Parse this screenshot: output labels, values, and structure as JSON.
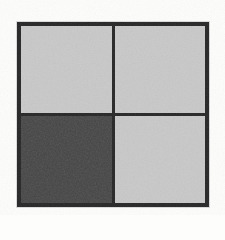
{
  "figure": {
    "medium": "scanned grayscale figure",
    "background_color": "#fdfdfc",
    "border_color": "#272727",
    "border_width_px": 4,
    "divider_width_px": 3,
    "columns": 2,
    "rows": 2,
    "cells": [
      {
        "position": "top-left",
        "row": 1,
        "column": 1,
        "shade": "light",
        "fill_color": "#c9c9c9",
        "label": ""
      },
      {
        "position": "top-right",
        "row": 1,
        "column": 2,
        "shade": "light",
        "fill_color": "#c9c9c9",
        "label": ""
      },
      {
        "position": "bottom-left",
        "row": 2,
        "column": 1,
        "shade": "dark",
        "fill_color": "#414141",
        "label": ""
      },
      {
        "position": "bottom-right",
        "row": 2,
        "column": 2,
        "shade": "light",
        "fill_color": "#c9c9c9",
        "label": ""
      }
    ]
  }
}
